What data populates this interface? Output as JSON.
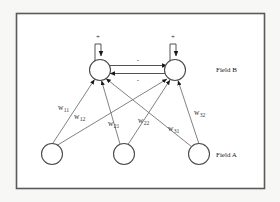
{
  "figure": {
    "type": "neural-network-diagram",
    "background_color": "#f7f7f5",
    "panel_color": "#ffffff",
    "border_color": "#5a5a5a",
    "line_color": "#6b6b6b",
    "arrow_color": "#1a1a1a"
  },
  "fields": {
    "upper": {
      "label": "Field B"
    },
    "lower": {
      "label": "Field A"
    }
  },
  "nodes": {
    "field_b": [
      {
        "id": "b1",
        "label": "",
        "cx": 100,
        "cy": 70,
        "r": 10.5
      },
      {
        "id": "b2",
        "label": "",
        "cx": 175,
        "cy": 70,
        "r": 10.5
      }
    ],
    "field_a": [
      {
        "id": "a1",
        "label": "",
        "cx": 52,
        "cy": 154,
        "r": 10.5
      },
      {
        "id": "a2",
        "label": "",
        "cx": 124,
        "cy": 154,
        "r": 10.5
      },
      {
        "id": "a3",
        "label": "",
        "cx": 199,
        "cy": 154,
        "r": 10.5
      }
    ]
  },
  "self_connections": [
    {
      "id": "b1-self",
      "node": "b1",
      "sign": "+"
    },
    {
      "id": "b2-self",
      "node": "b2",
      "sign": "+"
    }
  ],
  "lateral_connections": [
    {
      "id": "b1-to-b2",
      "from": "b1",
      "to": "b2",
      "sign": "-"
    },
    {
      "id": "b2-to-b1",
      "from": "b2",
      "to": "b1",
      "sign": "-"
    }
  ],
  "weights": [
    {
      "id": "w11",
      "base": "w",
      "sub": "11",
      "from": "a1",
      "to": "b1",
      "x": 60,
      "y": 110
    },
    {
      "id": "w12",
      "base": "w",
      "sub": "12",
      "from": "a1",
      "to": "b2",
      "x": 76,
      "y": 119
    },
    {
      "id": "w21",
      "base": "w",
      "sub": "21",
      "from": "a2",
      "to": "b1",
      "x": 110,
      "y": 126
    },
    {
      "id": "w22",
      "base": "w",
      "sub": "22",
      "from": "a2",
      "to": "b2",
      "x": 140,
      "y": 123
    },
    {
      "id": "w31",
      "base": "w",
      "sub": "31",
      "from": "a3",
      "to": "b1",
      "x": 170,
      "y": 131
    },
    {
      "id": "w32",
      "base": "w",
      "sub": "32",
      "from": "a3",
      "to": "b2",
      "x": 196,
      "y": 115
    }
  ],
  "labels": {
    "field_b_x": 216,
    "field_b_y": 72,
    "field_a_x": 216,
    "field_a_y": 157
  }
}
